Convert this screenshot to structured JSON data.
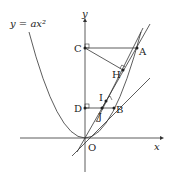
{
  "diagram": {
    "curve_label": "y = ax²",
    "axes": {
      "x_label": "x",
      "y_label": "y"
    },
    "points": {
      "O": "O",
      "A": "A",
      "B": "B",
      "C": "C",
      "D": "D",
      "H": "H",
      "I": "I",
      "J": "J"
    },
    "colors": {
      "stroke": "#333333",
      "background": "#ffffff"
    }
  }
}
